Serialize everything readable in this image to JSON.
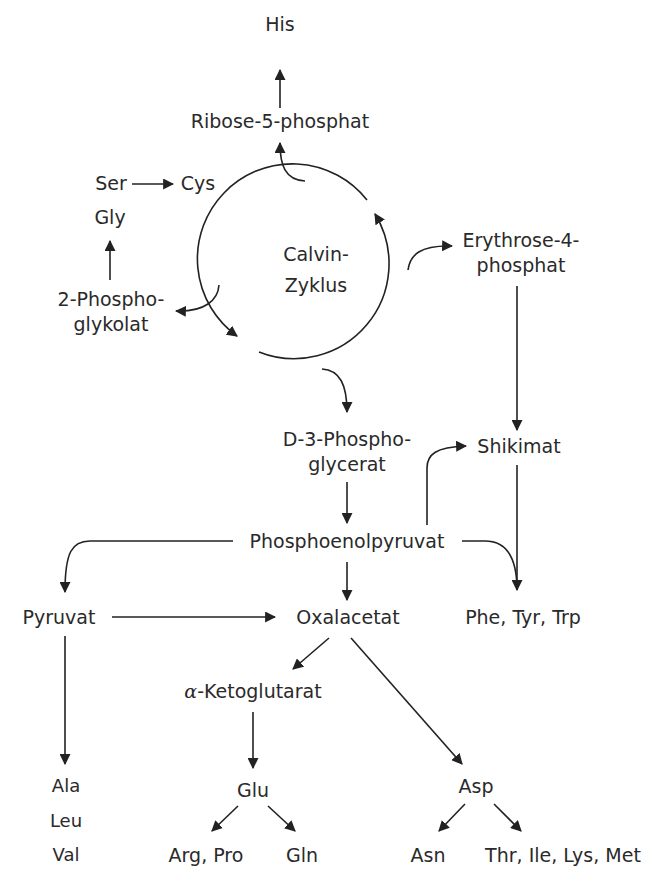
{
  "diagram": {
    "cycle": {
      "line1": "Calvin-",
      "line2": "Zyklus"
    },
    "nodes": {
      "his": "His",
      "ribose": "Ribose-5-phosphat",
      "ser": "Ser",
      "cys": "Cys",
      "gly": "Gly",
      "phosphoglykolat_1": "2-Phospho-",
      "phosphoglykolat_2": "glykolat",
      "erythrose_1": "Erythrose-4-",
      "erythrose_2": "phosphat",
      "pga_1": "D-3-Phospho-",
      "pga_2": "glycerat",
      "shikimat": "Shikimat",
      "pep": "Phosphoenolpyruvat",
      "pyruvat": "Pyruvat",
      "oxalacetat": "Oxalacetat",
      "aromatic": "Phe, Tyr, Trp",
      "ketoglutarat_prefix": "α",
      "ketoglutarat": "-Ketoglutarat",
      "ala": "Ala",
      "leu": "Leu",
      "val": "Val",
      "glu": "Glu",
      "asp": "Asp",
      "argpro": "Arg, Pro",
      "gln": "Gln",
      "asn": "Asn",
      "thr_group": "Thr, Ile, Lys, Met"
    },
    "edges": [
      {
        "from": "Ribose-5-phosphat",
        "to": "His"
      },
      {
        "from": "Calvin-Zyklus",
        "to": "Ribose-5-phosphat"
      },
      {
        "from": "Ser",
        "to": "Cys"
      },
      {
        "from": "2-Phosphoglykolat",
        "to": "Gly"
      },
      {
        "from": "Calvin-Zyklus",
        "to": "2-Phosphoglykolat"
      },
      {
        "from": "Calvin-Zyklus",
        "to": "Erythrose-4-phosphat"
      },
      {
        "from": "Calvin-Zyklus",
        "to": "D-3-Phosphoglycerat"
      },
      {
        "from": "Erythrose-4-phosphat",
        "to": "Shikimat"
      },
      {
        "from": "D-3-Phosphoglycerat",
        "to": "Phosphoenolpyruvat"
      },
      {
        "from": "Phosphoenolpyruvat",
        "to": "Shikimat"
      },
      {
        "from": "Shikimat",
        "to": "Phe, Tyr, Trp"
      },
      {
        "from": "Phosphoenolpyruvat",
        "to": "Phe, Tyr, Trp"
      },
      {
        "from": "Phosphoenolpyruvat",
        "to": "Pyruvat"
      },
      {
        "from": "Phosphoenolpyruvat",
        "to": "Oxalacetat"
      },
      {
        "from": "Pyruvat",
        "to": "Oxalacetat"
      },
      {
        "from": "Pyruvat",
        "to": "Ala, Leu, Val"
      },
      {
        "from": "Oxalacetat",
        "to": "α-Ketoglutarat"
      },
      {
        "from": "Oxalacetat",
        "to": "Asp"
      },
      {
        "from": "α-Ketoglutarat",
        "to": "Glu"
      },
      {
        "from": "Glu",
        "to": "Arg, Pro"
      },
      {
        "from": "Glu",
        "to": "Gln"
      },
      {
        "from": "Asp",
        "to": "Asn"
      },
      {
        "from": "Asp",
        "to": "Thr, Ile, Lys, Met"
      }
    ]
  }
}
